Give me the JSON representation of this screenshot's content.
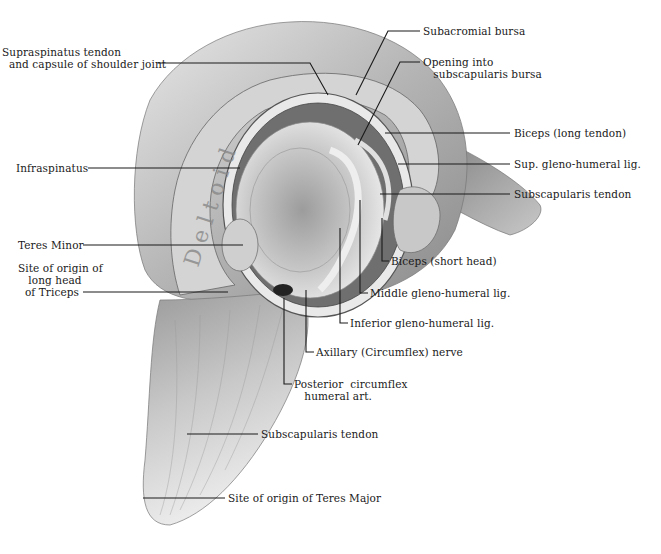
{
  "figure": {
    "kind": "anatomical illustration",
    "watermark_text_on_muscle": "Deltoid"
  },
  "labels": {
    "supraspinatus": "Supraspinatus tendon\n  and capsule of shoulder joint",
    "subacromial_bursa": "Subacromial bursa",
    "opening_subscapularis_bursa": "Opening into\n   subscapularis bursa",
    "biceps_long_tendon": "Biceps (long tendon)",
    "sup_gleno_humeral": "Sup. gleno-humeral lig.",
    "subscapularis_tendon_upper": "Subscapularis tendon",
    "infraspinatus": "Infraspinatus",
    "teres_minor": "Teres Minor",
    "triceps_origin": "Site of origin of\n   long head\n  of Triceps",
    "biceps_short_head": "Biceps (short head)",
    "middle_gleno_humeral": "Middle gleno-humeral lig.",
    "inferior_gleno_humeral": "Inferior gleno-humeral lig.",
    "axillary_nerve": "Axillary (Circumflex) nerve",
    "posterior_circumflex": "Posterior  circumflex\n   humeral art.",
    "subscapularis_tendon_lower": "Subscapularis tendon",
    "teres_major_origin": "Site of origin of Teres Major"
  },
  "colors": {
    "ink": "#1a1a1a",
    "background": "#ffffff",
    "muscle_light": "#d9d9d9",
    "muscle_mid": "#a8a8a8",
    "shadow": "#555555"
  }
}
